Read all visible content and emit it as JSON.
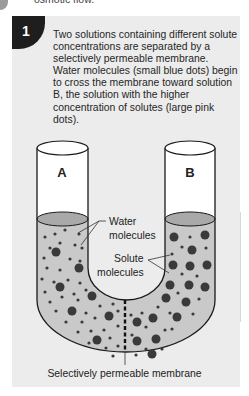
{
  "header_fragment": "osmotic flow.",
  "step": {
    "number": "1",
    "description": "Two solutions containing different solute concentrations are separated by a selectively permeable membrane. Water molecules (small blue dots) begin to cross the membrane toward solution B, the solution with the higher concentration of solutes (large pink dots)."
  },
  "diagram": {
    "tube_left_label": "A",
    "tube_right_label": "B",
    "water_label_line1": "Water",
    "water_label_line2": "molecules",
    "solute_label_line1": "Solute",
    "solute_label_line2": "molecules",
    "membrane_caption": "Selectively permeable membrane",
    "colors": {
      "panel_bg": "#ececec",
      "badge_bg": "#1e1e1e",
      "solution_fill": "#c9c9c9",
      "surface_fill": "#a9a9a9",
      "dots": "#3a3a3a",
      "outline": "#1a1a1a"
    }
  }
}
